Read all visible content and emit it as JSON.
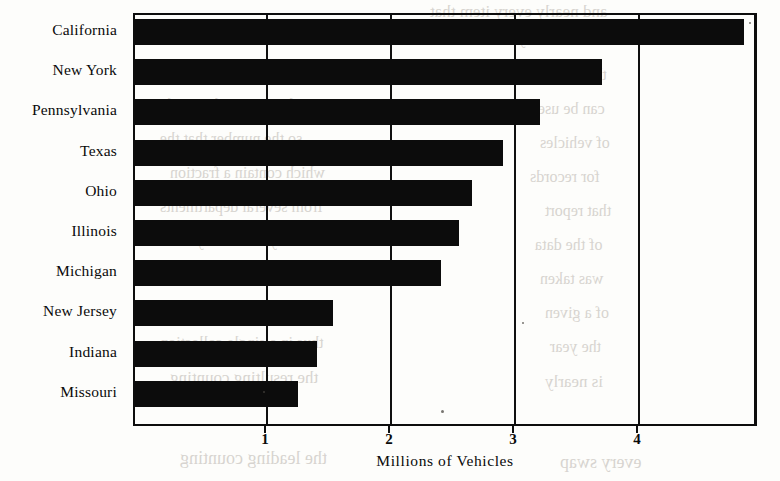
{
  "chart_data": {
    "type": "bar",
    "orientation": "horizontal",
    "title": "",
    "xlabel": "Millions of Vehicles",
    "ylabel": "",
    "categories": [
      "California",
      "New York",
      "Pennsylvania",
      "Texas",
      "Ohio",
      "Illinois",
      "Michigan",
      "New Jersey",
      "Indiana",
      "Missouri"
    ],
    "values": [
      4.85,
      3.7,
      3.2,
      2.9,
      2.65,
      2.55,
      2.4,
      1.53,
      1.4,
      1.25
    ],
    "xlim": [
      0,
      5.03
    ],
    "xticks": [
      1,
      2,
      3,
      4
    ],
    "xtick_labels": [
      "1",
      "2",
      "3",
      "4"
    ],
    "grid": "vertical",
    "legend": "none",
    "bar_color": "#0c0c0c",
    "background_color": "#fdfdfb"
  },
  "axis": {
    "x_title": "Millions of Vehicles"
  },
  "bleed_text": [
    {
      "text": "and nearly every item that",
      "x": 430,
      "y": 2,
      "size": 17
    },
    {
      "text": "the recording data as",
      "x": 150,
      "y": 26,
      "size": 17
    },
    {
      "text": "a limited by certain",
      "x": 470,
      "y": 30,
      "size": 16
    },
    {
      "text": "items of the registration",
      "x": 160,
      "y": 62,
      "size": 16
    },
    {
      "text": "the collection",
      "x": 520,
      "y": 66,
      "size": 16
    },
    {
      "text": "and returning the number",
      "x": 150,
      "y": 96,
      "size": 16
    },
    {
      "text": "can be used",
      "x": 530,
      "y": 100,
      "size": 16
    },
    {
      "text": "so the number that the",
      "x": 160,
      "y": 130,
      "size": 16
    },
    {
      "text": "of vehicles",
      "x": 540,
      "y": 134,
      "size": 16
    },
    {
      "text": "which contain a fraction",
      "x": 170,
      "y": 164,
      "size": 16
    },
    {
      "text": "for records",
      "x": 530,
      "y": 168,
      "size": 16
    },
    {
      "text": "from several departments",
      "x": 160,
      "y": 198,
      "size": 16
    },
    {
      "text": "that report",
      "x": 545,
      "y": 202,
      "size": 16
    },
    {
      "text": "many cases the years",
      "x": 170,
      "y": 232,
      "size": 16
    },
    {
      "text": "of the data",
      "x": 535,
      "y": 236,
      "size": 16
    },
    {
      "text": "In this period the count",
      "x": 160,
      "y": 266,
      "size": 16
    },
    {
      "text": "was taken",
      "x": 540,
      "y": 270,
      "size": 16
    },
    {
      "text": "a greater or smaller number",
      "x": 150,
      "y": 300,
      "size": 16
    },
    {
      "text": "of a given",
      "x": 545,
      "y": 304,
      "size": 16
    },
    {
      "text": "thus in a single collection",
      "x": 160,
      "y": 334,
      "size": 16
    },
    {
      "text": "the year",
      "x": 550,
      "y": 338,
      "size": 16
    },
    {
      "text": "the resulting counting",
      "x": 170,
      "y": 368,
      "size": 17
    },
    {
      "text": "is nearly",
      "x": 545,
      "y": 372,
      "size": 17
    },
    {
      "text": "the leading counting",
      "x": 180,
      "y": 448,
      "size": 18
    },
    {
      "text": "every swap",
      "x": 560,
      "y": 452,
      "size": 18
    }
  ],
  "specks": [
    {
      "x": 441,
      "y": 410,
      "size": 3
    },
    {
      "x": 749,
      "y": 22,
      "size": 2
    },
    {
      "x": 263,
      "y": 391,
      "size": 2
    },
    {
      "x": 522,
      "y": 322,
      "size": 2
    }
  ]
}
